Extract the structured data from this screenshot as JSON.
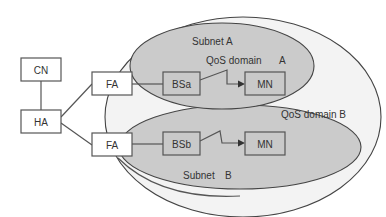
{
  "colors": {
    "background": "#ffffff",
    "outer_domain_fill": "#f2f2f2",
    "subnet_fill": "#c9c9c9",
    "box_fill_white": "#ffffff",
    "box_fill_gray": "#c9c9c9",
    "stroke": "#555555",
    "text": "#333333"
  },
  "regions": {
    "qos_domain_b": {
      "label": "QoS domain B"
    },
    "subnet_a": {
      "label": "Subnet A",
      "qos_label": "QoS domain",
      "qos_suffix": "A"
    },
    "subnet_b": {
      "label": "Subnet",
      "suffix": "B"
    }
  },
  "nodes": {
    "cn": {
      "label": "CN"
    },
    "ha": {
      "label": "HA"
    },
    "fa_top": {
      "label": "FA"
    },
    "fa_bottom": {
      "label": "FA"
    },
    "bsa": {
      "label": "BSa"
    },
    "bsb": {
      "label": "BSb"
    },
    "mn_top": {
      "label": "MN"
    },
    "mn_bottom": {
      "label": "MN"
    }
  },
  "edges": [
    {
      "from": "CN",
      "to": "HA",
      "type": "wired"
    },
    {
      "from": "HA",
      "to": "FA (top)",
      "type": "wired"
    },
    {
      "from": "HA",
      "to": "FA (bottom)",
      "type": "wired"
    },
    {
      "from": "FA (top)",
      "to": "BSa",
      "type": "wired"
    },
    {
      "from": "FA (bottom)",
      "to": "BSb",
      "type": "wired"
    },
    {
      "from": "BSa",
      "to": "MN (top)",
      "type": "wireless"
    },
    {
      "from": "BSb",
      "to": "MN (bottom)",
      "type": "wireless"
    }
  ]
}
